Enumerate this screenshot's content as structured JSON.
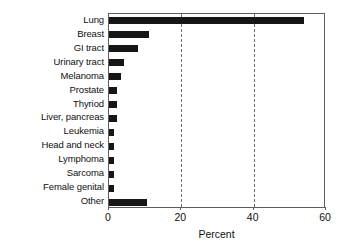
{
  "chart_data": {
    "type": "bar",
    "orientation": "horizontal",
    "title": "",
    "xlabel": "Percent",
    "ylabel": "",
    "xlim": [
      0,
      60
    ],
    "xticks": [
      0,
      20,
      40,
      60
    ],
    "xtick_labels": [
      "0",
      "20",
      "40",
      "60"
    ],
    "gridlines": [
      20,
      40
    ],
    "grid": true,
    "grid_style": "dashed-vertical",
    "legend": "none",
    "bar_color": "#161616",
    "categories": [
      "Lung",
      "Breast",
      "GI tract",
      "Urinary tract",
      "Melanoma",
      "Prostate",
      "Thyriod",
      "Liver, pancreas",
      "Leukemia",
      "Head and neck",
      "Lymphoma",
      "Sarcoma",
      "Female genital",
      "Other"
    ],
    "values": [
      54,
      11,
      8,
      4.2,
      3.3,
      2.2,
      2.2,
      2.2,
      1.3,
      1.3,
      1.3,
      1.3,
      1.3,
      10.5
    ]
  }
}
